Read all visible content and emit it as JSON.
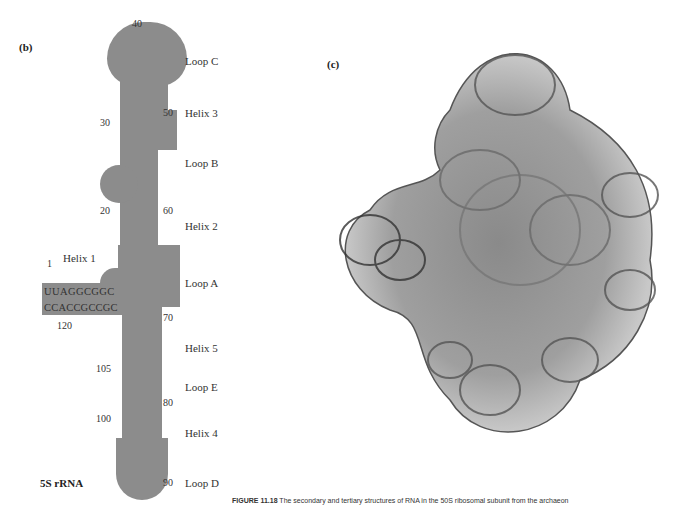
{
  "panels": {
    "b": {
      "label": "(b)",
      "name": "5S rRNA",
      "region_labels": [
        "Loop C",
        "Helix 3",
        "Loop B",
        "Helix 2",
        "Loop A",
        "Helix 5",
        "Loop E",
        "Helix 4",
        "Loop D"
      ],
      "helix1_label": "Helix 1",
      "position_numbers": [
        "40",
        "50",
        "30",
        "20",
        "60",
        "1",
        "120",
        "70",
        "105",
        "80",
        "100",
        "90"
      ],
      "strand_5prime_helix1": "UUAGGCGGC",
      "strand_3prime_helix1": "CCACCGCCGC",
      "loop_c": {
        "top": "C",
        "left": [
          "U",
          "A",
          "C",
          "C"
        ],
        "right": [
          "C",
          "C",
          "G",
          "A",
          "A"
        ]
      },
      "helix3_left": [
        "A",
        "U",
        "G",
        "C",
        "C"
      ],
      "helix3_right": [
        "C",
        "A",
        "C",
        "G",
        "G"
      ],
      "loop_b": [
        "A",
        "A",
        "U",
        "A",
        "A",
        "G",
        "U",
        "G",
        "U"
      ],
      "helix2_left": [
        "C",
        "U",
        "C",
        "C",
        "G",
        "G",
        "G",
        "U",
        "G",
        "G",
        "C"
      ],
      "helix2_right": [
        "G",
        "A",
        "U",
        "G",
        "C",
        "C",
        "C",
        "A",
        "C",
        "C",
        "G"
      ],
      "loop_a": [
        "A",
        "C",
        "A",
        "G",
        "C",
        "A",
        "G"
      ],
      "helix5_left": [
        "U",
        "U",
        "G",
        "G",
        "C",
        "C",
        "A",
        "A"
      ],
      "helix5_right": [
        "U",
        "U",
        "C",
        "C",
        "G",
        "G",
        "G",
        "A"
      ],
      "loop_e_left": [
        "A",
        "G",
        "G",
        "G",
        "C"
      ],
      "loop_e_right": [
        "G",
        "U",
        "A",
        "C",
        "U"
      ],
      "helix4_left": [
        "C",
        "U",
        "C",
        "C",
        "G"
      ],
      "helix4_right": [
        "G",
        "A",
        "G",
        "U",
        "G",
        "C"
      ],
      "loop_d": [
        "A",
        "G",
        "C",
        "G"
      ]
    },
    "c": {
      "label": "(c)",
      "image_description": "ribosome-50S-tertiary-structure"
    }
  },
  "caption": {
    "figure_number": "FIGURE 11.18",
    "text": "The secondary and tertiary structures of RNA in the 50S ribosomal subunit from the archaeon"
  },
  "colors": {
    "stem_fill": "#8c8c8c",
    "text": "#222222"
  }
}
